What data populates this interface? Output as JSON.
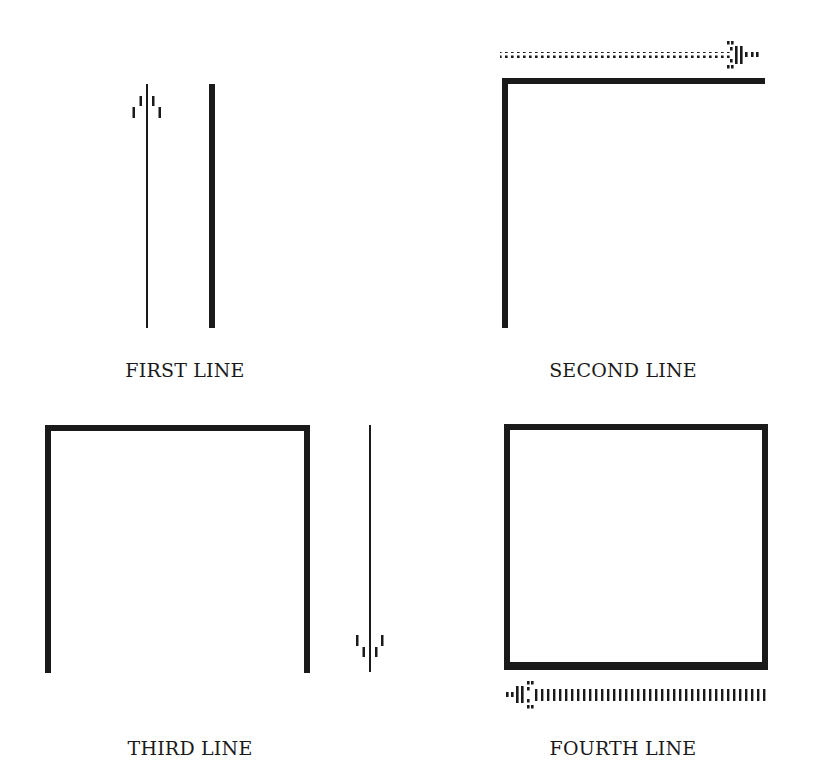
{
  "colors": {
    "ink": "#1a1a1a",
    "background": "#ffffff"
  },
  "panels": [
    {
      "id": "first",
      "label": "FIRST LINE",
      "caption_position": {
        "x": 185,
        "y": 359
      },
      "description": "Thin line with upward arrow beside completed thick vertical line"
    },
    {
      "id": "second",
      "label": "SECOND LINE",
      "caption_position": {
        "x": 623,
        "y": 359
      },
      "description": "Vertical thick line plus top horizontal line; dotted arrow pointing right"
    },
    {
      "id": "third",
      "label": "THIRD LINE",
      "caption_position": {
        "x": 190,
        "y": 737
      },
      "description": "Three sides drawn; thin line with downward arrow to the right"
    },
    {
      "id": "fourth",
      "label": "FOURTH LINE",
      "caption_position": {
        "x": 623,
        "y": 737
      },
      "description": "Closed square; dotted arrow pointing left below bottom edge"
    }
  ],
  "arrows": [
    {
      "panel": "first",
      "direction": "up",
      "style": "thin"
    },
    {
      "panel": "second",
      "direction": "right",
      "style": "dotted"
    },
    {
      "panel": "third",
      "direction": "down",
      "style": "thin"
    },
    {
      "panel": "fourth",
      "direction": "left",
      "style": "dotted"
    }
  ]
}
